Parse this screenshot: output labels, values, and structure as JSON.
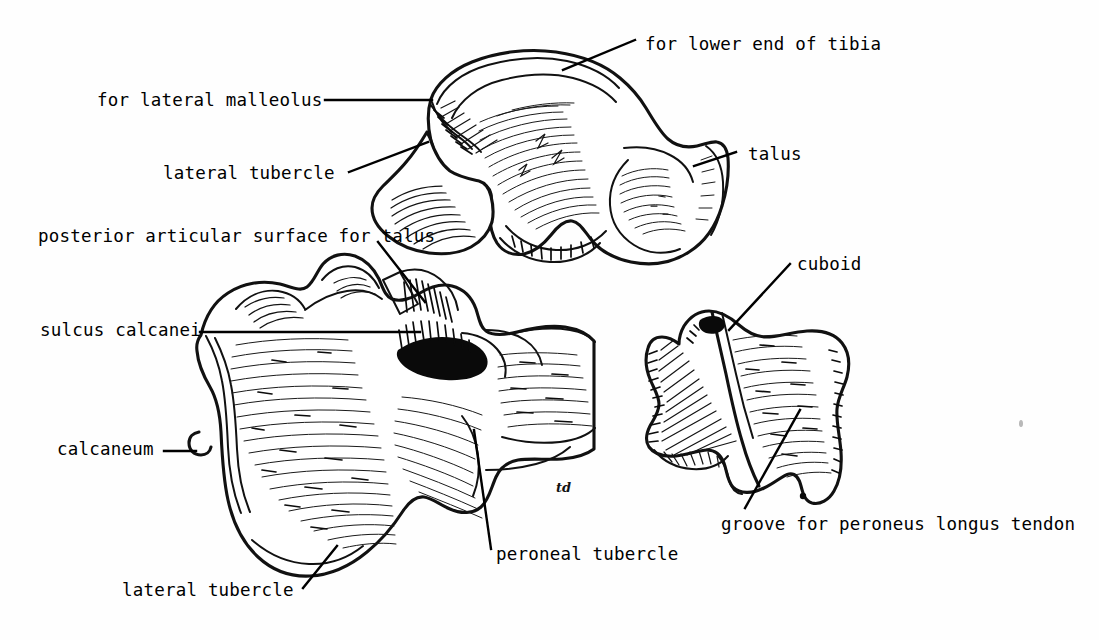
{
  "figure": {
    "background_color": "#fefefe",
    "ink_color": "#000000",
    "signature": "td"
  },
  "labels": [
    {
      "id": "for-lower-end-of-tibia",
      "text": "for lower end of tibia",
      "x": 645,
      "y": 36,
      "points_to": "talus-trochlear-surface"
    },
    {
      "id": "for-lateral-malleolus",
      "text": "for lateral malleolus",
      "x": 97,
      "y": 92,
      "points_to": "talus-lateral-malleolar-facet"
    },
    {
      "id": "talus",
      "text": "talus",
      "x": 748,
      "y": 146,
      "points_to": "talus-body"
    },
    {
      "id": "lateral-tubercle-talus",
      "text": "lateral tubercle",
      "x": 163,
      "y": 165,
      "points_to": "talus-posterior-lateral-tubercle"
    },
    {
      "id": "posterior-articular-surface-for-talus",
      "text": "posterior articular surface for talus",
      "x": 38,
      "y": 228,
      "points_to": "calcaneum-posterior-facet"
    },
    {
      "id": "cuboid",
      "text": "cuboid",
      "x": 797,
      "y": 256,
      "points_to": "cuboid-body"
    },
    {
      "id": "sulcus-calcanei",
      "text": "sulcus calcanei",
      "x": 40,
      "y": 322,
      "points_to": "calcaneum-sulcus"
    },
    {
      "id": "calcaneum",
      "text": "calcaneum",
      "x": 57,
      "y": 441,
      "points_to": "calcaneum-body"
    },
    {
      "id": "groove-for-peroneus-longus-tendon",
      "text": "groove for peroneus longus tendon",
      "x": 721,
      "y": 516,
      "points_to": "cuboid-peroneal-groove"
    },
    {
      "id": "peroneal-tubercle",
      "text": "peroneal tubercle",
      "x": 496,
      "y": 546,
      "points_to": "calcaneum-peroneal-tubercle"
    },
    {
      "id": "lateral-tubercle-calcaneum",
      "text": "lateral tubercle",
      "x": 122,
      "y": 582,
      "points_to": "calcaneum-lateral-tubercle"
    }
  ],
  "structures": [
    {
      "id": "talus",
      "name": "talus",
      "view": "lateral"
    },
    {
      "id": "calcaneum",
      "name": "calcaneum",
      "view": "lateral"
    },
    {
      "id": "cuboid",
      "name": "cuboid",
      "view": "lateral"
    }
  ]
}
